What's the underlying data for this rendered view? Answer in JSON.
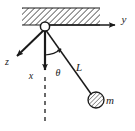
{
  "figure": {
    "type": "physics-free-body-diagram",
    "background_color": "#ffffff",
    "stroke_color": "#1a1a1a",
    "hatch_color": "#555555"
  },
  "ceiling": {
    "name": "hatched-ceiling-support",
    "x": 22,
    "y": 8,
    "width": 78,
    "height": 17,
    "hatch_angle_deg": 45,
    "hatch_spacing": 3
  },
  "pivot": {
    "name": "pivot-point",
    "x": 45,
    "y": 27,
    "radius": 5
  },
  "axes": [
    {
      "id": "y-axis",
      "label": "y",
      "label_x": 124,
      "label_y": 23,
      "from_x": 45,
      "from_y": 25,
      "to_x": 117,
      "to_y": 25
    },
    {
      "id": "z-axis",
      "label": "z",
      "label_x": 7,
      "label_y": 65,
      "from_x": 45,
      "from_y": 29,
      "to_x": 15,
      "to_y": 58
    },
    {
      "id": "x-axis",
      "label": "x",
      "label_x": 31,
      "label_y": 79,
      "from_x": 45,
      "from_y": 29,
      "to_x": 45,
      "to_y": 73
    }
  ],
  "vertical_reference": {
    "name": "vertical-dashed-reference-line",
    "from_x": 45,
    "from_y": 76,
    "to_x": 45,
    "to_y": 123,
    "dash_pattern": "4 4"
  },
  "string": {
    "name": "pendulum-string",
    "label": "L",
    "label_x": 79,
    "label_y": 71,
    "from_x": 45,
    "from_y": 29,
    "to_x": 92,
    "to_y": 95
  },
  "angle": {
    "name": "angle-theta",
    "label": "θ",
    "label_x": 58,
    "label_y": 76,
    "arc_radius": 26,
    "arc_from_deg": 90,
    "arc_to_deg": 55
  },
  "bob": {
    "name": "pendulum-bob-mass",
    "label": "m",
    "label_x": 108,
    "label_y": 104,
    "cx": 96,
    "cy": 100,
    "r": 8,
    "hatch_angle_deg": 45
  }
}
